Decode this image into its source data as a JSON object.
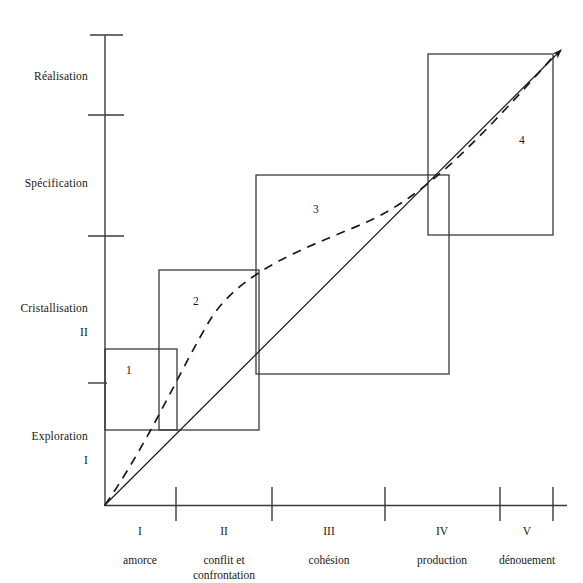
{
  "figure": {
    "type": "diagram",
    "background_color": "#ffffff",
    "line_color": "#3a3a3a",
    "text_color": "#171717"
  },
  "y_axis": {
    "name": "vertical-axis",
    "labels": [
      {
        "text": "Réalisation",
        "sub": "",
        "y": 65
      },
      {
        "text": "Spécification",
        "sub": "",
        "y": 172
      },
      {
        "text": "Cristallisation",
        "sub": "II",
        "y": 297
      },
      {
        "text": "Exploration",
        "sub": "I",
        "y": 425
      }
    ],
    "ticks": [
      35,
      115,
      236,
      383
    ]
  },
  "x_axis": {
    "name": "horizontal-axis",
    "ticks": [
      176,
      272,
      385,
      500,
      553
    ],
    "labels": [
      {
        "roman": "I",
        "text": "amorce",
        "center": 140
      },
      {
        "roman": "II",
        "text": "conflit et\nconfrontation",
        "center": 224
      },
      {
        "roman": "III",
        "text": "cohésion",
        "center": 329
      },
      {
        "roman": "IV",
        "text": "production",
        "center": 442
      },
      {
        "roman": "V",
        "text": "dénouement",
        "center": 527
      }
    ]
  },
  "boxes": [
    {
      "id": "1",
      "label": "1",
      "x": 105,
      "y": 349,
      "w": 72,
      "h": 81,
      "label_x": 129,
      "label_y": 371
    },
    {
      "id": "2",
      "label": "2",
      "x": 159,
      "y": 270,
      "w": 100,
      "h": 160,
      "label_x": 196,
      "label_y": 301
    },
    {
      "id": "3",
      "label": "3",
      "x": 256,
      "y": 175,
      "w": 193,
      "h": 199,
      "label_x": 316,
      "label_y": 209
    },
    {
      "id": "4",
      "label": "4",
      "x": 428,
      "y": 54,
      "w": 125,
      "h": 181,
      "label_x": 522,
      "label_y": 141
    }
  ],
  "curves": {
    "straight_arrow": {
      "name": "diagonal-reference-line",
      "from": [
        105,
        505
      ],
      "to": [
        565,
        46
      ],
      "style": "solid-with-arrowhead"
    },
    "dashed_curve": {
      "name": "progression-curve",
      "style": "dashed",
      "points": [
        [
          105,
          505
        ],
        [
          140,
          448
        ],
        [
          170,
          390
        ],
        [
          196,
          336
        ],
        [
          228,
          297
        ],
        [
          256,
          276
        ],
        [
          300,
          249
        ],
        [
          350,
          228
        ],
        [
          400,
          205
        ],
        [
          440,
          182
        ],
        [
          480,
          145
        ],
        [
          520,
          105
        ],
        [
          556,
          60
        ]
      ]
    }
  }
}
